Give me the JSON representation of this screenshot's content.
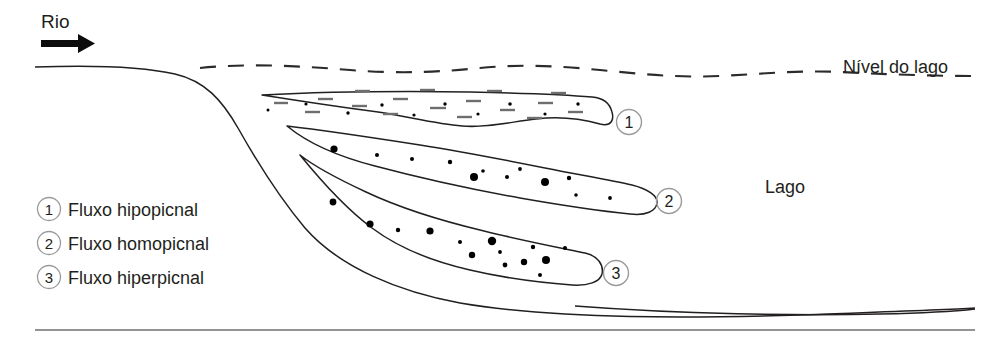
{
  "figure": {
    "type": "diagram",
    "labels": {
      "river": "Rio",
      "lake_level": "Nível do lago",
      "lake": "Lago"
    },
    "flows": [
      {
        "id": "1",
        "marker": "1",
        "name": "Fluxo hipopicnal",
        "position": "superficial, junto ao nível do lago"
      },
      {
        "id": "2",
        "marker": "2",
        "name": "Fluxo homopicnal",
        "position": "intermediário, no interior da coluna d'água"
      },
      {
        "id": "3",
        "marker": "3",
        "name": "Fluxo hiperpicnal",
        "position": "basal, junto ao fundo do lago"
      }
    ],
    "legend": {
      "items": [
        {
          "marker": "1",
          "label": "Fluxo hipopicnal"
        },
        {
          "marker": "2",
          "label": "Fluxo homopicnal"
        },
        {
          "marker": "3",
          "label": "Fluxo hiperpicnal"
        }
      ]
    },
    "callouts": [
      {
        "marker": "1"
      },
      {
        "marker": "2"
      },
      {
        "marker": "3"
      }
    ],
    "colors": {
      "ink": "#231f20",
      "circle_outline": "#9a9a9a",
      "dash_gray": "#6e6e6e",
      "baseline": "#6f6f6f",
      "background": "#ffffff"
    },
    "icons": {
      "flow_arrow": "right-arrow-icon"
    }
  }
}
